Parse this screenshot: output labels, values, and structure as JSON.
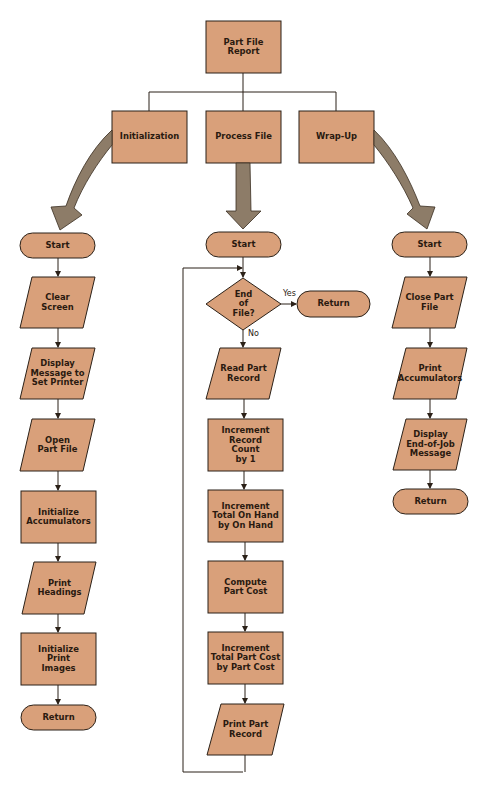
{
  "colors": {
    "fill": "#d9a07a",
    "stroke": "#2b2118",
    "arrow_fill": "#8d7c68",
    "line": "#2b2118",
    "background": "#ffffff"
  },
  "top": {
    "title": "Part File\nReport"
  },
  "modules": [
    {
      "label": "Initialization"
    },
    {
      "label": "Process File"
    },
    {
      "label": "Wrap-Up"
    }
  ],
  "initialization": {
    "steps": [
      {
        "shape": "terminal",
        "label": "Start"
      },
      {
        "shape": "io",
        "label": "Clear\nScreen"
      },
      {
        "shape": "io",
        "label": "Display\nMessage to\nSet Printer"
      },
      {
        "shape": "io",
        "label": "Open\nPart File"
      },
      {
        "shape": "process",
        "label": "Initialize\nAccumulators"
      },
      {
        "shape": "io",
        "label": "Print\nHeadings"
      },
      {
        "shape": "process",
        "label": "Initialize\nPrint\nImages"
      },
      {
        "shape": "terminal",
        "label": "Return"
      }
    ]
  },
  "process_file": {
    "start": "Start",
    "decision": "End\nof\nFile?",
    "yes_label": "Yes",
    "no_label": "No",
    "yes_target": "Return",
    "steps": [
      {
        "shape": "io",
        "label": "Read Part\nRecord"
      },
      {
        "shape": "process",
        "label": "Increment\nRecord\nCount\nby 1"
      },
      {
        "shape": "process",
        "label": "Increment\nTotal On Hand\nby On Hand"
      },
      {
        "shape": "process",
        "label": "Compute\nPart Cost"
      },
      {
        "shape": "process",
        "label": "Increment\nTotal Part Cost\nby Part Cost"
      },
      {
        "shape": "io",
        "label": "Print Part\nRecord"
      }
    ]
  },
  "wrap_up": {
    "steps": [
      {
        "shape": "terminal",
        "label": "Start"
      },
      {
        "shape": "io",
        "label": "Close Part\nFile"
      },
      {
        "shape": "io",
        "label": "Print\nAccumulators"
      },
      {
        "shape": "io",
        "label": "Display\nEnd-of-Job\nMessage"
      },
      {
        "shape": "terminal",
        "label": "Return"
      }
    ]
  }
}
